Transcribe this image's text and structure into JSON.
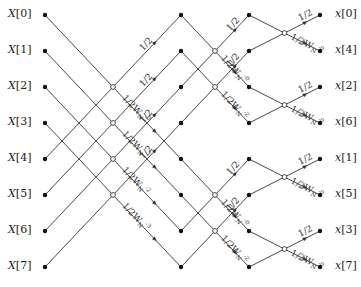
{
  "diagram": {
    "type": "8-point inverse FFT butterfly (decimation-in-frequency) signal flow graph",
    "inputs": [
      "X[0]",
      "X[1]",
      "X[2]",
      "X[3]",
      "X[4]",
      "X[5]",
      "X[6]",
      "X[7]"
    ],
    "outputs": [
      "x[0]",
      "x[4]",
      "x[2]",
      "x[6]",
      "x[1]",
      "x[5]",
      "x[3]",
      "x[7]"
    ],
    "stage1": {
      "upper_gains": [
        "1/2",
        "1/2",
        "1/2",
        "1/2"
      ],
      "lower_gains": [
        "1/2W_N^-0",
        "1/2W_N^-1",
        "1/2W_N^-2",
        "1/2W_N^-3"
      ]
    },
    "stage2": {
      "upper_gains": [
        "1/2",
        "1/2",
        "1/2",
        "1/2"
      ],
      "lower_gains": [
        "1/2W_N^-0",
        "1/2W_N^-2",
        "1/2W_N^-0",
        "1/2W_N^-2"
      ]
    },
    "stage3": {
      "upper_gains": [
        "1/2",
        "1/2",
        "1/2",
        "1/2"
      ],
      "lower_gains": [
        "1/2W_N^-0",
        "1/2W_N^-0",
        "1/2W_N^-0",
        "1/2W_N^-0"
      ]
    },
    "colors": {
      "line": "#333333",
      "node": "#111111"
    }
  }
}
